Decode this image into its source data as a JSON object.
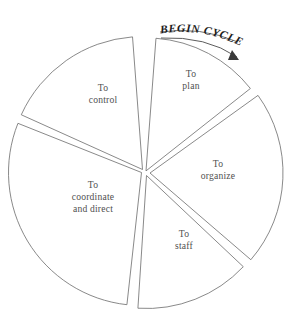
{
  "diagram": {
    "type": "exploded-pie",
    "heading": {
      "label": "BEGIN CYCLE",
      "arrow_icon": "curved-arrow-clockwise-icon"
    },
    "geometry": {
      "center_x": 144.5,
      "center_y": 171.5,
      "radius": 133,
      "gap_degrees": 2.6
    },
    "colors": {
      "background": "#ffffff",
      "slice_fill": "#ffffff",
      "slice_stroke": "#6b6b6b",
      "label_text": "#4f4f4f",
      "heading_text": "#1c1c1c",
      "arc_stroke": "#4a4a4a"
    },
    "slices": [
      {
        "id": "plan",
        "name": "to-plan",
        "lines": [
          "To",
          "plan"
        ],
        "start_deg": 3,
        "end_deg": 53,
        "label_x": 191,
        "label_y": 83,
        "offset_x": 1.5,
        "offset_y": -0.6
      },
      {
        "id": "organize",
        "name": "to-organize",
        "lines": [
          "To",
          "organize"
        ],
        "start_deg": 53,
        "end_deg": 132,
        "label_x": 218,
        "label_y": 173,
        "offset_x": 5.5,
        "offset_y": 1.5
      },
      {
        "id": "staff",
        "name": "to-staff",
        "lines": [
          "To",
          "staff"
        ],
        "start_deg": 132,
        "end_deg": 185,
        "label_x": 184,
        "label_y": 243,
        "offset_x": 2.0,
        "offset_y": 4.0
      },
      {
        "id": "coordinate",
        "name": "to-coordinate-and-direct",
        "lines": [
          "To",
          "coordinate",
          "and direct"
        ],
        "start_deg": 185,
        "end_deg": 293,
        "label_x": 93,
        "label_y": 200,
        "offset_x": -3.0,
        "offset_y": 1.0
      },
      {
        "id": "control",
        "name": "to-control",
        "lines": [
          "To",
          "control"
        ],
        "start_deg": 293,
        "end_deg": 357,
        "label_x": 103,
        "label_y": 97,
        "offset_x": -2.0,
        "offset_y": -2.0
      }
    ]
  }
}
